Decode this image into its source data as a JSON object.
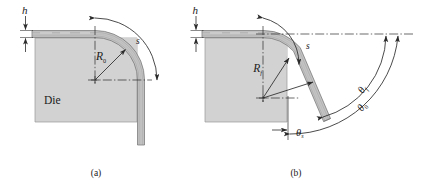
{
  "figure": {
    "panels": [
      {
        "id": "a",
        "caption": "(a)",
        "caption_x": 96,
        "caption_y": 176,
        "labels": {
          "thickness": "h",
          "radius": "R",
          "radius_sub": "0",
          "arc_length": "s",
          "die": "Die"
        }
      },
      {
        "id": "b",
        "caption": "(b)",
        "caption_x": 296,
        "caption_y": 176,
        "labels": {
          "thickness": "h",
          "radius": "R",
          "radius_sub": "f",
          "arc_length": "s",
          "theta": "θ",
          "theta_final_sub": "f",
          "theta_initial_sub": "0",
          "theta_springback_sub": "s"
        }
      }
    ],
    "colors": {
      "die_fill": "#d2d2d2",
      "die_stroke": "#8a8a8a",
      "sheet_fill": "#c4c4c4",
      "line": "#2b2b2b",
      "text": "#1a1a1a",
      "background": "#ffffff"
    }
  }
}
